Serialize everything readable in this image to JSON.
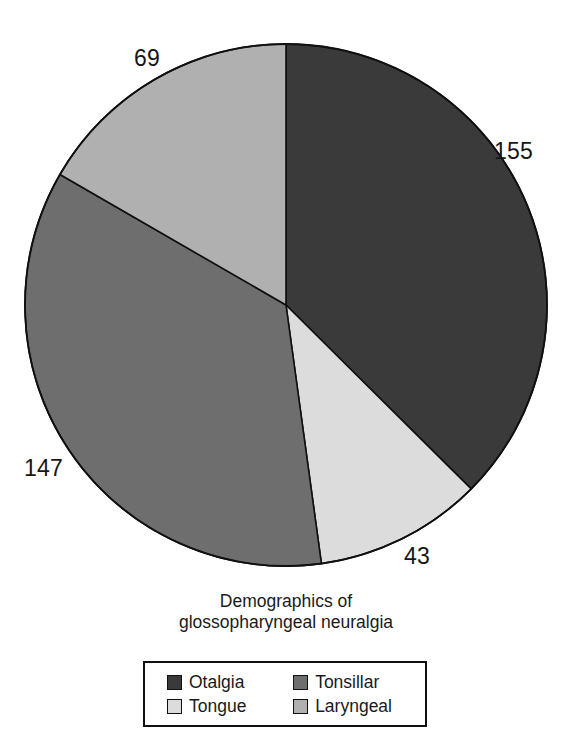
{
  "chart_data": {
    "type": "pie",
    "title": "Demographics of glossopharyngeal neuralgia",
    "title_lines": [
      "Demographics of",
      "glossopharyngeal neuralgia"
    ],
    "categories": [
      "Otalgia",
      "Tonsillar",
      "Tongue",
      "Laryngeal"
    ],
    "values": [
      155,
      147,
      43,
      69
    ],
    "total": 414,
    "slices": [
      {
        "label": "Otalgia",
        "value": 155,
        "value_text": "155",
        "color": "#3a3a3a",
        "start_angle_deg": 0,
        "sweep_deg": 134.8,
        "label_x": 494,
        "label_y": 140
      },
      {
        "label": "Tongue",
        "value": 43,
        "value_text": "43",
        "color": "#dcdcdc",
        "start_angle_deg": 134.8,
        "sweep_deg": 37.4,
        "label_x": 404,
        "label_y": 545
      },
      {
        "label": "Tonsillar",
        "value": 147,
        "value_text": "147",
        "color": "#6e6e6e",
        "start_angle_deg": 172.2,
        "sweep_deg": 127.8,
        "label_x": 24,
        "label_y": 457
      },
      {
        "label": "Laryngeal",
        "value": 69,
        "value_text": "69",
        "color": "#b0b0b0",
        "start_angle_deg": 300.0,
        "sweep_deg": 60.0,
        "label_x": 134,
        "label_y": 47
      }
    ],
    "geometry": {
      "center_x": 286,
      "center_y": 305,
      "radius": 261,
      "start_at_12_oclock": true,
      "direction": "clockwise"
    },
    "legend_position": "bottom",
    "grid": false,
    "xlabel": "",
    "ylabel": ""
  },
  "legend": {
    "rows": [
      [
        {
          "label": "Otalgia",
          "color": "#3a3a3a"
        },
        {
          "label": "Tonsillar",
          "color": "#6e6e6e"
        }
      ],
      [
        {
          "label": "Tongue",
          "color": "#dcdcdc"
        },
        {
          "label": "Laryngeal",
          "color": "#b0b0b0"
        }
      ]
    ]
  },
  "caption": {
    "text": ""
  }
}
